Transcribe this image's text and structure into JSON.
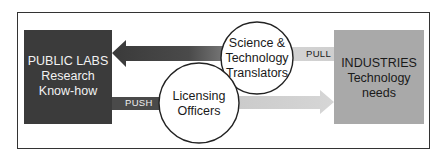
{
  "diagram": {
    "left_box": {
      "lines": [
        "PUBLIC LABS",
        "Research",
        "Know-how"
      ],
      "color": "#3b3b3b"
    },
    "right_box": {
      "lines": [
        "INDUSTRIES",
        "Technology",
        "needs"
      ],
      "color": "#a9a9a9"
    },
    "top_circle": {
      "lines": [
        "Science &",
        "Technology",
        "Translators"
      ]
    },
    "bottom_circle": {
      "lines": [
        "Licensing",
        "Officers"
      ]
    },
    "labels": {
      "push": "PUSH",
      "pull": "PULL"
    },
    "arrows": [
      {
        "name": "pull-arrow",
        "direction": "left",
        "from": "INDUSTRIES",
        "to": "PUBLIC LABS"
      },
      {
        "name": "push-arrow",
        "direction": "right",
        "from": "PUBLIC LABS",
        "to": "INDUSTRIES"
      }
    ]
  }
}
